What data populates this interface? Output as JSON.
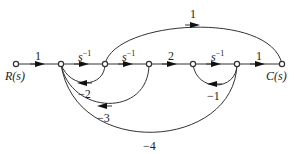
{
  "diagram": {
    "type": "signal-flow-graph",
    "input_label": "R(s)",
    "output_label": "C(s)",
    "nodes": [
      "R",
      "n1",
      "n2",
      "n3",
      "n4",
      "n5",
      "C"
    ],
    "forward_branches": [
      {
        "from": "R",
        "to": "n1",
        "gain": "1"
      },
      {
        "from": "n1",
        "to": "n2",
        "gain": "s",
        "exp": "−1"
      },
      {
        "from": "n2",
        "to": "n3",
        "gain": "s",
        "exp": "−1"
      },
      {
        "from": "n3",
        "to": "n4",
        "gain": "2"
      },
      {
        "from": "n4",
        "to": "n5",
        "gain": "s",
        "exp": "−1"
      },
      {
        "from": "n5",
        "to": "C",
        "gain": "1"
      }
    ],
    "feedforward_branches": [
      {
        "from": "n2",
        "to": "C",
        "gain": "1"
      }
    ],
    "feedback_branches": [
      {
        "from": "n2",
        "to": "n1",
        "gain": "−2"
      },
      {
        "from": "n3",
        "to": "n1",
        "gain": "−3"
      },
      {
        "from": "n5",
        "to": "n4",
        "gain": "−1"
      },
      {
        "from": "n5",
        "to": "n1",
        "gain": "−4"
      }
    ]
  }
}
